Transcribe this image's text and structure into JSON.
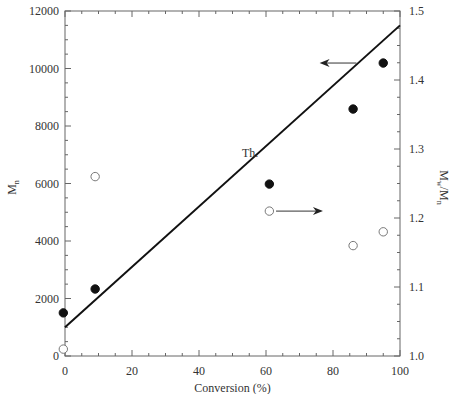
{
  "chart_data": {
    "type": "scatter",
    "title": "",
    "xlabel": "Conversion (%)",
    "ylabel": "Mn",
    "ylabel_right": "Mw/Mn",
    "xlim": [
      0,
      100
    ],
    "ylim": [
      0,
      12000
    ],
    "ylim_right": [
      1.0,
      1.5
    ],
    "x_ticks": [
      0,
      20,
      40,
      60,
      80,
      100
    ],
    "y_ticks": [
      0,
      2000,
      4000,
      6000,
      8000,
      10000,
      12000
    ],
    "y_right_ticks": [
      1.0,
      1.1,
      1.2,
      1.3,
      1.4,
      1.5
    ],
    "grid": false,
    "legend": null,
    "series": [
      {
        "name": "Mn",
        "axis": "left",
        "marker": "filled-circle",
        "x": [
          -0.5,
          9,
          61,
          86,
          95
        ],
        "y": [
          1500,
          2330,
          5980,
          8590,
          10190
        ]
      },
      {
        "name": "Mw/Mn",
        "axis": "right",
        "marker": "open-circle",
        "x": [
          -0.5,
          9,
          61,
          86,
          95
        ],
        "y": [
          1.01,
          1.26,
          1.21,
          1.16,
          1.18
        ]
      },
      {
        "name": "Th.",
        "axis": "left",
        "type": "line",
        "x": [
          0,
          100
        ],
        "y": [
          1000,
          11500
        ]
      }
    ],
    "annotations": [
      {
        "text": "Th.",
        "x": 54,
        "y": 7200,
        "note": "label for theoretical line"
      },
      {
        "text": "arrow-left",
        "from_x": 87,
        "to_x": 76,
        "y": 10190,
        "note": "points Mn series to left axis"
      },
      {
        "text": "arrow-right",
        "from_x": 63,
        "to_x": 77,
        "y": 1.21,
        "note": "points Mw/Mn series to right axis"
      }
    ]
  },
  "labels": {
    "xlabel": "Conversion (%)",
    "ylabel_main": "M",
    "ylabel_main_sub": "n",
    "ylabel_right_main": "M",
    "ylabel_right_sub1": "w",
    "ylabel_right_mid": "/M",
    "ylabel_right_sub2": "n",
    "th_label": "Th."
  }
}
